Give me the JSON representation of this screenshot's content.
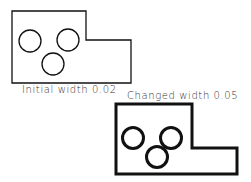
{
  "diagram": {
    "shapes": [
      {
        "label": "Initial width 0.02",
        "stroke_width": 0.02,
        "stroke_px": 1.3,
        "outline": [
          [
            12,
            11
          ],
          [
            86,
            11
          ],
          [
            86,
            40
          ],
          [
            131,
            40
          ],
          [
            131,
            83
          ],
          [
            12,
            83
          ]
        ],
        "circles": [
          {
            "cx": 30,
            "cy": 41,
            "r": 11
          },
          {
            "cx": 68,
            "cy": 40,
            "r": 11
          },
          {
            "cx": 53,
            "cy": 64,
            "r": 11
          }
        ]
      },
      {
        "label": "Changed width 0.05",
        "stroke_width": 0.05,
        "stroke_px": 3,
        "outline": [
          [
            116,
            104
          ],
          [
            192,
            104
          ],
          [
            192,
            148
          ],
          [
            237,
            148
          ],
          [
            237,
            174
          ],
          [
            116,
            174
          ]
        ],
        "circles": [
          {
            "cx": 133,
            "cy": 138,
            "r": 10.5
          },
          {
            "cx": 171,
            "cy": 138,
            "r": 10.5
          },
          {
            "cx": 157,
            "cy": 157,
            "r": 10.5
          }
        ]
      }
    ],
    "colors": {
      "stroke": "#111111",
      "text": "#333333",
      "background": "#ffffff"
    }
  }
}
